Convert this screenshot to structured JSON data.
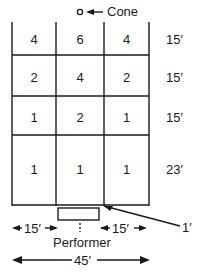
{
  "cone": {
    "label": "Cone"
  },
  "grid": {
    "rows": [
      {
        "values": [
          "4",
          "6",
          "4"
        ],
        "depth": "15′"
      },
      {
        "values": [
          "2",
          "4",
          "2"
        ],
        "depth": "15′"
      },
      {
        "values": [
          "1",
          "2",
          "1"
        ],
        "depth": "15′"
      },
      {
        "values": [
          "1",
          "1",
          "1"
        ],
        "depth": "23′"
      }
    ]
  },
  "performer": {
    "label": "Performer",
    "gap": "1′"
  },
  "dimensions": {
    "left": "15′",
    "right": "15′",
    "total": "45′"
  }
}
